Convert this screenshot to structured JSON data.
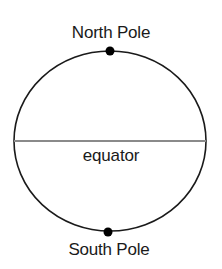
{
  "diagram": {
    "labels": {
      "north": "North Pole",
      "south": "South Pole",
      "equator": "equator"
    },
    "colors": {
      "outline": "#1a1a1a",
      "equator_line": "#8a8a8a",
      "pole_dot": "#000000"
    }
  }
}
